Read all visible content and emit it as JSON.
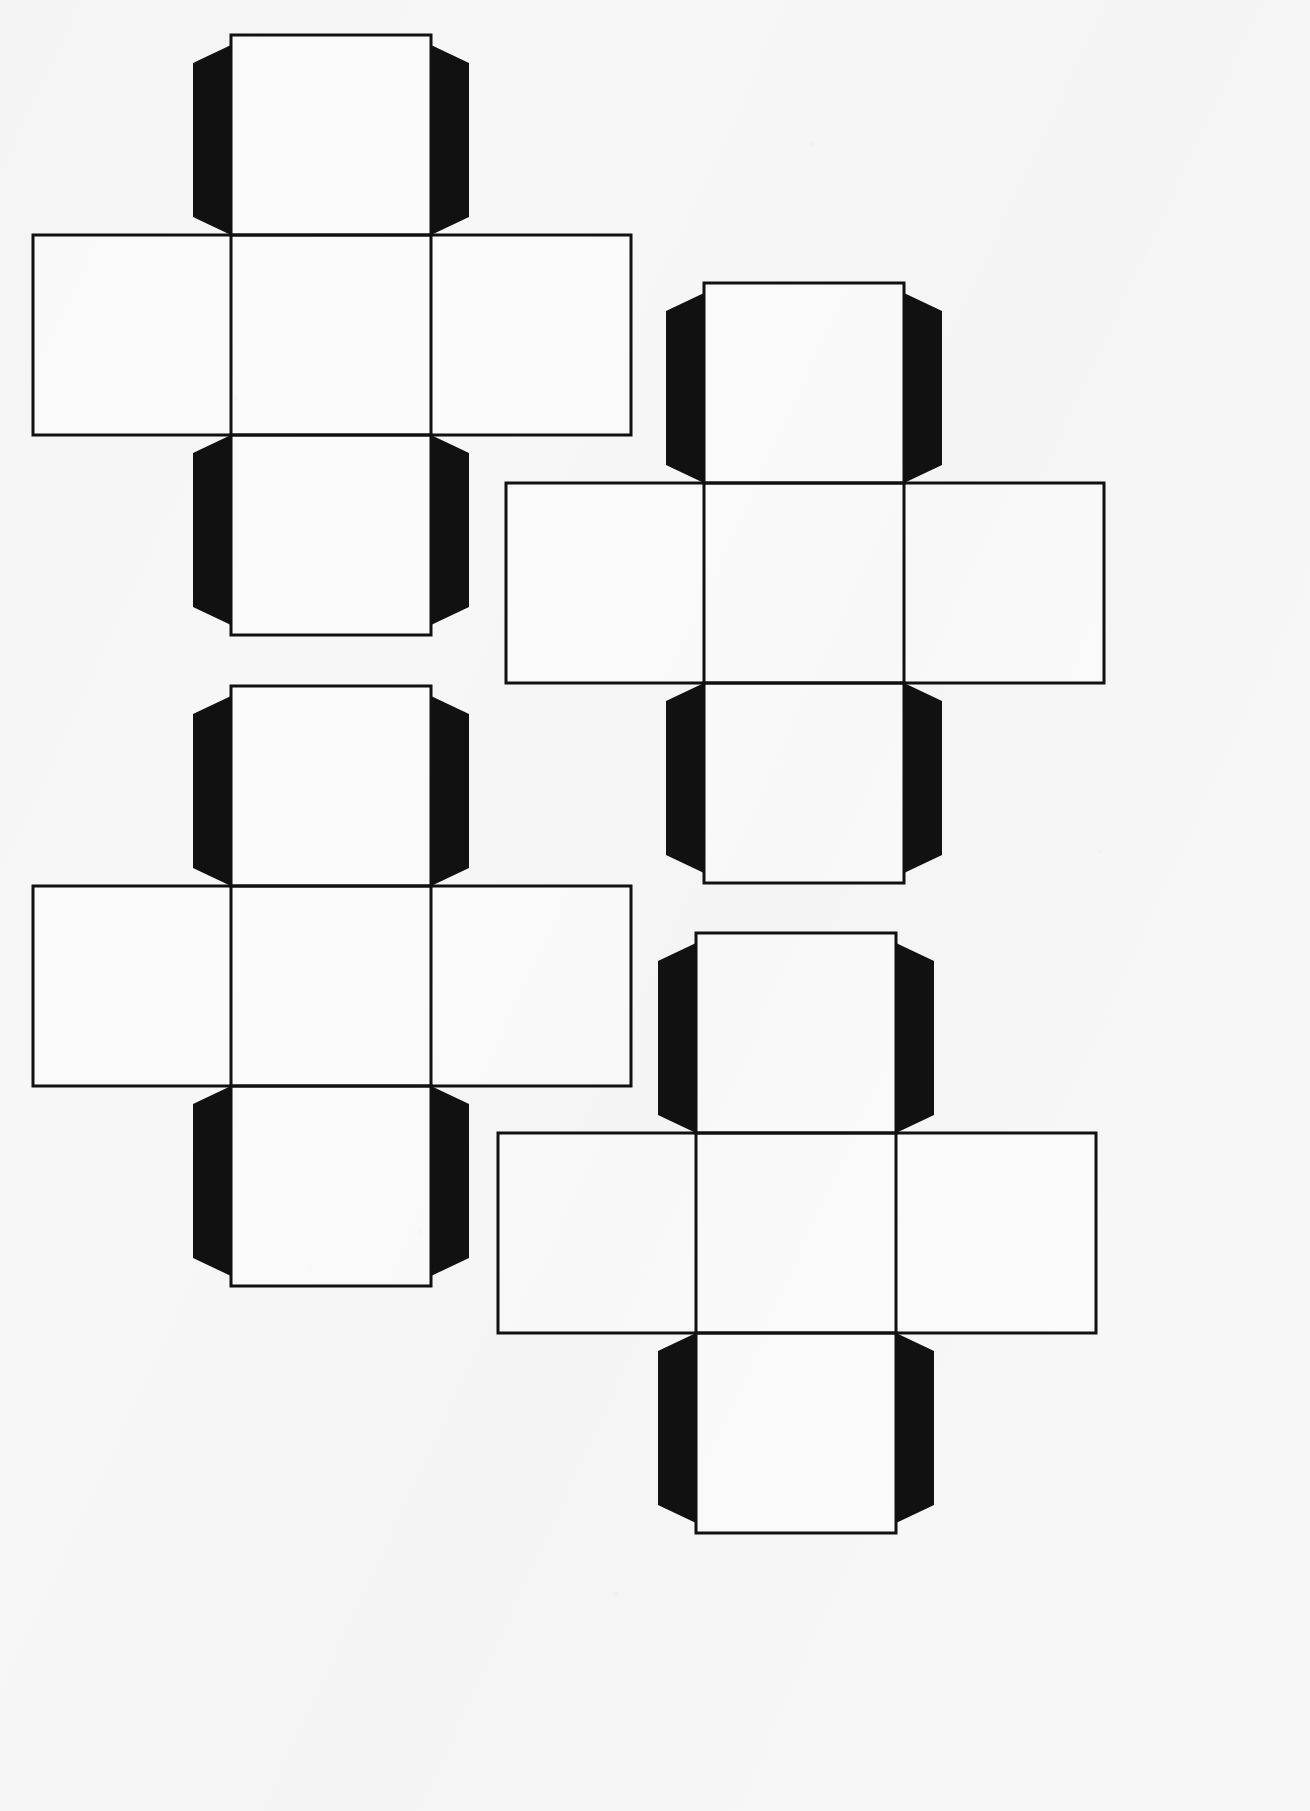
{
  "document": {
    "title": "Cube Net Template Sheet",
    "kind": "papercraft-cutout-sheet",
    "page_width": 1310,
    "page_height": 1811,
    "background_color": "#f7f7f7",
    "line_color": "#111111",
    "tab_color": "#111111",
    "face_fill_color": "#fbfbfb",
    "line_width": 3,
    "net_count": 4,
    "description": "Four identical cross-shaped cube nets (six square faces each) with solid black glue tabs."
  },
  "nets": [
    {
      "id": "net-top-left",
      "label": "Cube Net 1",
      "position": "top-left",
      "origin_x": 30,
      "origin_y": 32,
      "face_size": 200,
      "band_left_extension": 198,
      "band_right_extension": 200,
      "tab_width": 38,
      "tab_inset": 18,
      "faces": [
        {
          "name": "top-face",
          "role": "top"
        },
        {
          "name": "left-face",
          "role": "left"
        },
        {
          "name": "center-face",
          "role": "front"
        },
        {
          "name": "right-face",
          "role": "right"
        },
        {
          "name": "bottom-face",
          "role": "bottom"
        }
      ],
      "tabs": [
        {
          "name": "tab-top-left",
          "side": "left",
          "attached_to": "top-face"
        },
        {
          "name": "tab-top-right",
          "side": "right",
          "attached_to": "top-face"
        },
        {
          "name": "tab-bottom-left",
          "side": "left",
          "attached_to": "bottom-face"
        },
        {
          "name": "tab-bottom-right",
          "side": "right",
          "attached_to": "bottom-face"
        }
      ]
    },
    {
      "id": "net-top-right",
      "label": "Cube Net 2",
      "position": "top-right",
      "origin_x": 503,
      "origin_y": 280,
      "face_size": 200,
      "band_left_extension": 198,
      "band_right_extension": 200,
      "tab_width": 38,
      "tab_inset": 18,
      "faces": [
        {
          "name": "top-face",
          "role": "top"
        },
        {
          "name": "left-face",
          "role": "left"
        },
        {
          "name": "center-face",
          "role": "front"
        },
        {
          "name": "right-face",
          "role": "right"
        },
        {
          "name": "bottom-face",
          "role": "bottom"
        }
      ],
      "tabs": [
        {
          "name": "tab-top-left",
          "side": "left",
          "attached_to": "top-face"
        },
        {
          "name": "tab-top-right",
          "side": "right",
          "attached_to": "top-face"
        },
        {
          "name": "tab-bottom-left",
          "side": "left",
          "attached_to": "bottom-face"
        },
        {
          "name": "tab-bottom-right",
          "side": "right",
          "attached_to": "bottom-face"
        }
      ]
    },
    {
      "id": "net-bottom-left",
      "label": "Cube Net 3",
      "position": "bottom-left",
      "origin_x": 30,
      "origin_y": 683,
      "face_size": 200,
      "band_left_extension": 198,
      "band_right_extension": 200,
      "tab_width": 38,
      "tab_inset": 18,
      "faces": [
        {
          "name": "top-face",
          "role": "top"
        },
        {
          "name": "left-face",
          "role": "left"
        },
        {
          "name": "center-face",
          "role": "front"
        },
        {
          "name": "right-face",
          "role": "right"
        },
        {
          "name": "bottom-face",
          "role": "bottom"
        }
      ],
      "tabs": [
        {
          "name": "tab-top-left",
          "side": "left",
          "attached_to": "top-face"
        },
        {
          "name": "tab-top-right",
          "side": "right",
          "attached_to": "top-face"
        },
        {
          "name": "tab-bottom-left",
          "side": "left",
          "attached_to": "bottom-face"
        },
        {
          "name": "tab-bottom-right",
          "side": "right",
          "attached_to": "bottom-face"
        }
      ]
    },
    {
      "id": "net-bottom-right",
      "label": "Cube Net 4",
      "position": "bottom-right",
      "origin_x": 495,
      "origin_y": 930,
      "face_size": 200,
      "band_left_extension": 198,
      "band_right_extension": 200,
      "tab_width": 38,
      "tab_inset": 18,
      "faces": [
        {
          "name": "top-face",
          "role": "top"
        },
        {
          "name": "left-face",
          "role": "left"
        },
        {
          "name": "center-face",
          "role": "front"
        },
        {
          "name": "right-face",
          "role": "right"
        },
        {
          "name": "bottom-face",
          "role": "bottom"
        }
      ],
      "tabs": [
        {
          "name": "tab-top-left",
          "side": "left",
          "attached_to": "top-face"
        },
        {
          "name": "tab-top-right",
          "side": "right",
          "attached_to": "top-face"
        },
        {
          "name": "tab-bottom-left",
          "side": "left",
          "attached_to": "bottom-face"
        },
        {
          "name": "tab-bottom-right",
          "side": "right",
          "attached_to": "bottom-face"
        }
      ]
    }
  ]
}
